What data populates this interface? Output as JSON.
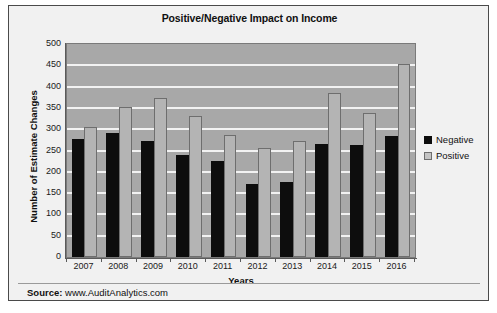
{
  "chart_data": {
    "type": "bar",
    "title": "Positive/Negative Impact on Income",
    "xlabel": "Years",
    "ylabel": "Number of Estimate Changes",
    "categories": [
      "2007",
      "2008",
      "2009",
      "2010",
      "2011",
      "2012",
      "2013",
      "2014",
      "2015",
      "2016"
    ],
    "series": [
      {
        "name": "Negative",
        "color": "#0d0d0d",
        "values": [
          278,
          291,
          272,
          240,
          225,
          171,
          177,
          266,
          262,
          283
        ]
      },
      {
        "name": "Positive",
        "color": "#b4b4b4",
        "values": [
          305,
          352,
          374,
          332,
          286,
          256,
          273,
          386,
          337,
          454
        ]
      }
    ],
    "ylim": [
      0,
      500
    ],
    "ytick_step": 50,
    "yticks": [
      "500",
      "450",
      "400",
      "350",
      "300",
      "250",
      "200",
      "150",
      "100",
      "50",
      "0"
    ],
    "grid": true,
    "legend_position": "right",
    "plot_background": "#a8a8a8",
    "gridline_color": "#f2f2f2"
  },
  "footer": {
    "source_label": "Source:",
    "source_value": " www.AuditAnalytics.com"
  }
}
